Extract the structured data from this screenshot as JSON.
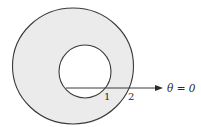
{
  "diagram": {
    "type": "annulus-polar-region",
    "colors": {
      "ring_fill": "#ebebeb",
      "inner_fill": "#ffffff",
      "stroke": "#3a3a3a",
      "background": "#ffffff"
    },
    "outer_circle": {
      "cx": 73,
      "cy": 66,
      "r": 60,
      "radius_label": "2"
    },
    "inner_circle": {
      "cx": 85,
      "cy": 71,
      "r": 26,
      "radius_label": "1"
    },
    "polar_axis": {
      "x1": 66,
      "y1": 88,
      "x2": 162,
      "y2": 88,
      "label": "θ = 0"
    },
    "labels": {
      "inner_radius": "1",
      "outer_radius": "2",
      "axis": "θ = 0"
    }
  }
}
